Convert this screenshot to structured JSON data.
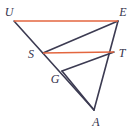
{
  "figure": {
    "width": 134,
    "height": 130,
    "background": "#ffffff",
    "colors": {
      "line_dark": "#3c3b52",
      "line_accent": "#e3663f",
      "label_text": "#35334c"
    },
    "points": [
      {
        "id": "U",
        "label": "U",
        "x": 14,
        "y": 21,
        "label_x": 9,
        "label_y": 12
      },
      {
        "id": "E",
        "label": "E",
        "x": 118,
        "y": 21,
        "label_x": 123,
        "label_y": 12
      },
      {
        "id": "S",
        "label": "S",
        "x": 43,
        "y": 53,
        "label_x": 31,
        "label_y": 54
      },
      {
        "id": "T",
        "label": "T",
        "x": 114,
        "y": 52,
        "label_x": 122,
        "label_y": 53
      },
      {
        "id": "G",
        "label": "G",
        "x": 62,
        "y": 71,
        "label_x": 55,
        "label_y": 79
      },
      {
        "id": "A",
        "label": "A",
        "x": 94,
        "y": 110,
        "label_x": 96,
        "label_y": 122
      }
    ],
    "segments": [
      {
        "id": "UE",
        "from": "U",
        "to": "E",
        "style": "accent",
        "note": "top parallel segment"
      },
      {
        "id": "ST",
        "from": "S",
        "to": "T",
        "style": "accent",
        "note": "middle parallel segment"
      },
      {
        "id": "UA",
        "from": "U",
        "to": "A",
        "style": "dark",
        "note": "transversal through S and G"
      },
      {
        "id": "EA",
        "from": "E",
        "to": "A",
        "style": "dark",
        "note": "transversal through T"
      },
      {
        "id": "ES",
        "from": "E",
        "to": "S",
        "style": "dark"
      },
      {
        "id": "TG",
        "from": "T",
        "to": "G",
        "style": "dark"
      },
      {
        "id": "GA",
        "from": "G",
        "to": "A",
        "style": "dark",
        "note": "coincides with UA lower portion"
      }
    ]
  }
}
